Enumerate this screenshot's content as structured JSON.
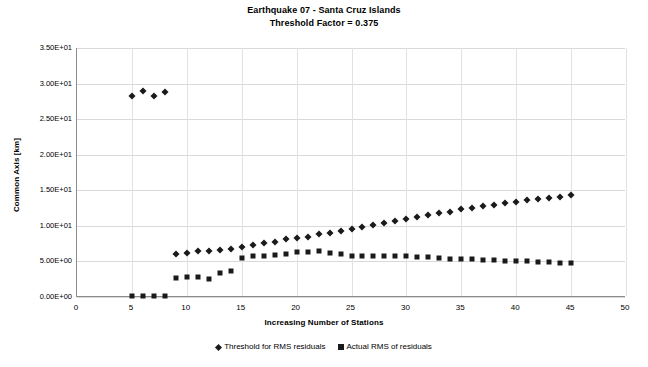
{
  "chart_data": {
    "type": "scatter",
    "title": "Earthquake 07 - Santa Cruz Islands",
    "subtitle": "Threshold Factor = 0.375",
    "xlabel": "Increasing Number of Stations",
    "ylabel": "Common Axis [km]",
    "xlim": [
      0,
      50
    ],
    "ylim": [
      0,
      35
    ],
    "xticks": [
      0,
      5,
      10,
      15,
      20,
      25,
      30,
      35,
      40,
      45,
      50
    ],
    "xtick_labels": [
      "0",
      "5",
      "10",
      "15",
      "20",
      "25",
      "30",
      "35",
      "40",
      "45",
      "50"
    ],
    "yticks": [
      0,
      5,
      10,
      15,
      20,
      25,
      30,
      35
    ],
    "ytick_labels": [
      "0.00E+00",
      "5.00E+00",
      "1.00E+01",
      "1.50E+01",
      "2.00E+01",
      "2.50E+01",
      "3.00E+01",
      "3.50E+01"
    ],
    "grid": "horizontal-and-vertical",
    "legend_position": "bottom",
    "marker_color": "#1a1a1a",
    "series": [
      {
        "name": "Threshold for RMS residuals",
        "marker": "diamond",
        "x": [
          5,
          6,
          7,
          8,
          9,
          10,
          11,
          12,
          13,
          14,
          15,
          16,
          17,
          18,
          19,
          20,
          21,
          22,
          23,
          24,
          25,
          26,
          27,
          28,
          29,
          30,
          31,
          32,
          33,
          34,
          35,
          36,
          37,
          38,
          39,
          40,
          41,
          42,
          43,
          44,
          45
        ],
        "y": [
          28.3,
          29.0,
          28.3,
          28.8,
          6.0,
          6.2,
          6.4,
          6.5,
          6.6,
          6.8,
          7.0,
          7.3,
          7.6,
          7.7,
          8.1,
          8.3,
          8.5,
          8.8,
          9.0,
          9.3,
          9.6,
          9.8,
          10.1,
          10.4,
          10.7,
          11.0,
          11.3,
          11.5,
          11.8,
          12.0,
          12.3,
          12.5,
          12.8,
          13.0,
          13.2,
          13.4,
          13.6,
          13.8,
          13.9,
          14.1,
          14.4
        ]
      },
      {
        "name": "Actual RMS of residuals",
        "marker": "square",
        "x": [
          5,
          6,
          7,
          8,
          9,
          10,
          11,
          12,
          13,
          14,
          15,
          16,
          17,
          18,
          19,
          20,
          21,
          22,
          23,
          24,
          25,
          26,
          27,
          28,
          29,
          30,
          31,
          32,
          33,
          34,
          35,
          36,
          37,
          38,
          39,
          40,
          41,
          42,
          43,
          44,
          45
        ],
        "y": [
          0.1,
          0.1,
          0.1,
          0.1,
          2.7,
          2.8,
          2.8,
          2.6,
          3.4,
          3.6,
          5.5,
          5.7,
          5.8,
          5.9,
          6.1,
          6.3,
          6.3,
          6.4,
          6.2,
          6.0,
          5.8,
          5.7,
          5.8,
          5.7,
          5.7,
          5.7,
          5.6,
          5.6,
          5.5,
          5.4,
          5.4,
          5.3,
          5.2,
          5.2,
          5.1,
          5.0,
          5.0,
          4.9,
          4.9,
          4.8,
          4.8
        ]
      }
    ]
  }
}
